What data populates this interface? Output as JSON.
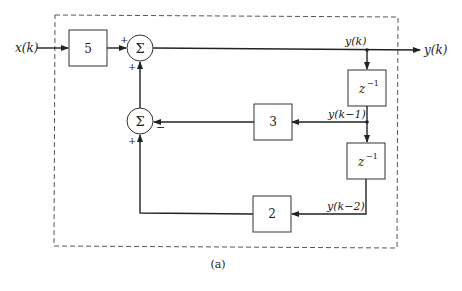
{
  "diagram": {
    "caption": "(a)",
    "input_label": "x(k)",
    "output_label": "y(k)",
    "blocks": {
      "gain_input": "5",
      "gain_feedback1": "3",
      "gain_feedback2": "2",
      "delay1": "z",
      "delay1_exp": "−1",
      "delay2": "z",
      "delay2_exp": "−1"
    },
    "summers": {
      "sum1_symbol": "Σ",
      "sum1_sign_left": "+",
      "sum1_sign_bottom": "+",
      "sum2_symbol": "Σ",
      "sum2_sign_right": "−",
      "sum2_sign_bottom": "+"
    },
    "signals": {
      "y_k": "y(k)",
      "y_k1": "y(k−1)",
      "y_k2": "y(k−2)"
    }
  }
}
